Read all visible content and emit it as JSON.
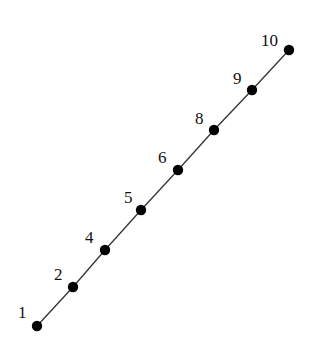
{
  "diagram": {
    "type": "path-graph",
    "line_color": "#333333",
    "node_color": "#000000",
    "nodes": [
      {
        "label": "1",
        "x": 37,
        "y": 326,
        "lx": 18,
        "ly": 318
      },
      {
        "label": "2",
        "x": 73,
        "y": 287,
        "lx": 54,
        "ly": 280
      },
      {
        "label": "4",
        "x": 105,
        "y": 250,
        "lx": 85,
        "ly": 243
      },
      {
        "label": "5",
        "x": 141,
        "y": 210,
        "lx": 124,
        "ly": 203
      },
      {
        "label": "6",
        "x": 178,
        "y": 170,
        "lx": 158,
        "ly": 163
      },
      {
        "label": "8",
        "x": 214,
        "y": 130,
        "lx": 195,
        "ly": 124
      },
      {
        "label": "9",
        "x": 252,
        "y": 90,
        "lx": 233,
        "ly": 84
      },
      {
        "label": "10",
        "x": 289,
        "y": 50,
        "lx": 261,
        "ly": 46
      }
    ]
  }
}
